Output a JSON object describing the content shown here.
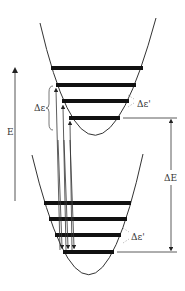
{
  "diagram": {
    "type": "energy-level-diagram",
    "colors": {
      "line": "#333333",
      "band": "#111111",
      "background": "#ffffff",
      "dash": "#999999"
    },
    "labels": {
      "energy_axis": "E",
      "upper_spacing": "Δε",
      "upper_spacing_prime": "Δε'",
      "gap": "ΔE",
      "lower_spacing_prime": "Δε'"
    },
    "upper_well": {
      "levels": 4,
      "bands_y": [
        68,
        85,
        101,
        118
      ]
    },
    "lower_well": {
      "levels": 4,
      "bands_y": [
        203,
        219,
        235,
        252
      ]
    },
    "transitions": {
      "absorption_arrows": 3,
      "emission_arrows": 3
    }
  }
}
